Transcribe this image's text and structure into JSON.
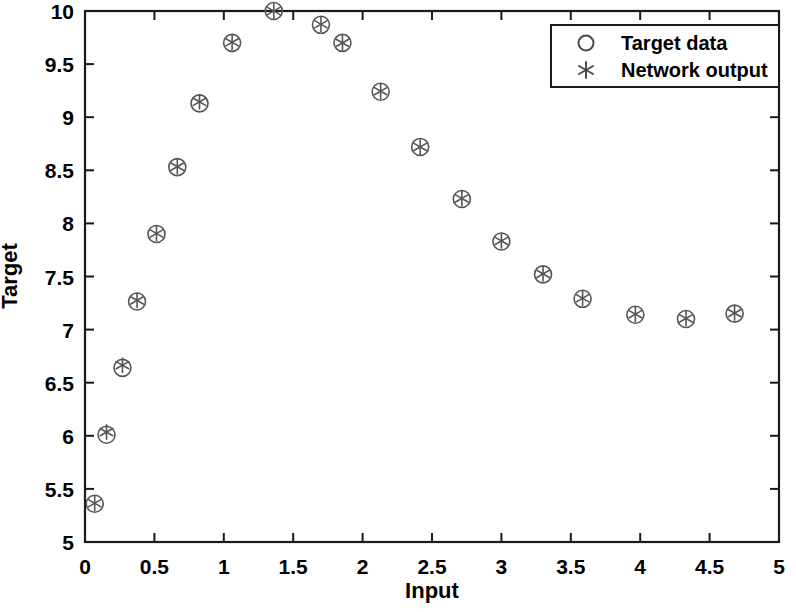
{
  "chart_data": {
    "type": "scatter",
    "title": "",
    "xlabel": "Input",
    "ylabel": "Target",
    "xlim": [
      0,
      5
    ],
    "ylim": [
      5,
      10
    ],
    "xticks": [
      "0",
      "0.5",
      "1",
      "1.5",
      "2",
      "2.5",
      "3",
      "3.5",
      "4",
      "4.5",
      "5"
    ],
    "xtick_values": [
      0,
      0.5,
      1,
      1.5,
      2,
      2.5,
      3,
      3.5,
      4,
      4.5,
      5
    ],
    "yticks": [
      "5",
      "5.5",
      "6",
      "6.5",
      "7",
      "7.5",
      "8",
      "8.5",
      "9",
      "9.5",
      "10"
    ],
    "ytick_values": [
      5,
      5.5,
      6,
      6.5,
      7,
      7.5,
      8,
      8.5,
      9,
      9.5,
      10
    ],
    "grid": false,
    "legend_position": "top-right",
    "series": [
      {
        "name": "Target data",
        "marker": "circle-open",
        "color": "#555555",
        "x": [
          0.07,
          0.155,
          0.27,
          0.375,
          0.515,
          0.665,
          0.825,
          1.06,
          1.36,
          1.7,
          1.855,
          2.13,
          2.415,
          2.715,
          3.0,
          3.3,
          3.585,
          3.965,
          4.33,
          4.68
        ],
        "y": [
          5.36,
          6.01,
          6.64,
          7.265,
          7.9,
          8.53,
          9.13,
          9.7,
          10.0,
          9.87,
          9.7,
          9.24,
          8.72,
          8.23,
          7.83,
          7.52,
          7.29,
          7.14,
          7.1,
          7.15
        ]
      },
      {
        "name": "Network output",
        "marker": "asterisk",
        "color": "#555555",
        "x": [
          0.07,
          0.155,
          0.27,
          0.375,
          0.515,
          0.665,
          0.825,
          1.06,
          1.36,
          1.7,
          1.855,
          2.13,
          2.415,
          2.715,
          3.0,
          3.3,
          3.585,
          3.965,
          4.33,
          4.68
        ],
        "y": [
          5.365,
          6.035,
          6.665,
          7.275,
          7.905,
          8.535,
          9.145,
          9.705,
          10.0,
          9.875,
          9.7,
          9.245,
          8.72,
          8.235,
          7.835,
          7.525,
          7.295,
          7.145,
          7.105,
          7.155
        ]
      }
    ]
  },
  "axes": {
    "xlabel": "Input",
    "ylabel": "Target"
  },
  "legend": {
    "entries": [
      {
        "label": "Target data",
        "marker": "circle-open"
      },
      {
        "label": "Network output",
        "marker": "asterisk"
      }
    ]
  },
  "colors": {
    "axis": "#1a1a1a",
    "marker": "#606060",
    "background": "#ffffff"
  }
}
